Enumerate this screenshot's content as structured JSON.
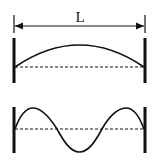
{
  "diagram": {
    "dimension_label": "L",
    "panels": [
      {
        "id": "top",
        "mode": "fundamental",
        "half_wavelengths": 1
      },
      {
        "id": "bottom",
        "mode": "higher harmonic",
        "half_wavelengths": 3
      }
    ],
    "colors": {
      "ink": "#111111",
      "background": "#ffffff"
    }
  }
}
